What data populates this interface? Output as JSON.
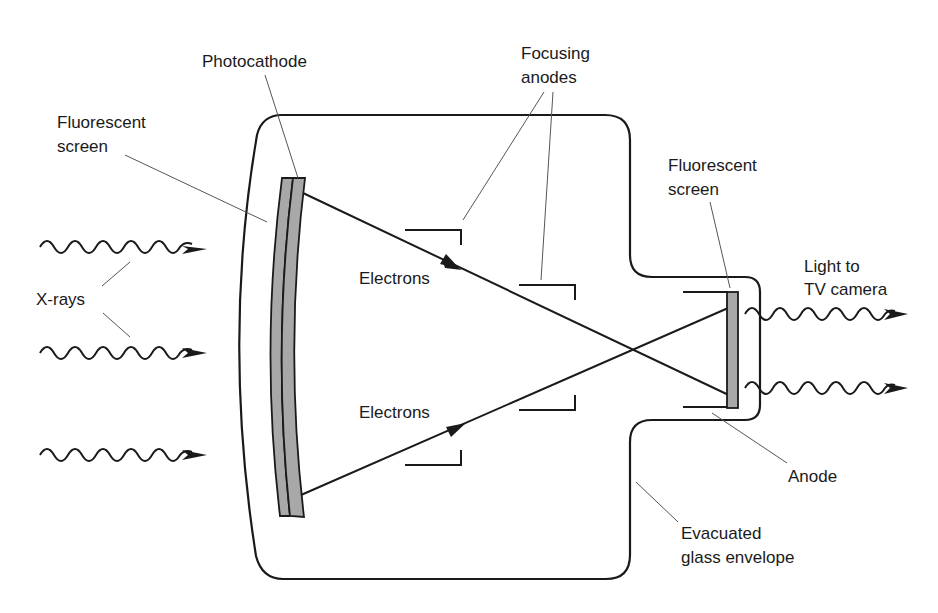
{
  "diagram": {
    "colors": {
      "stroke": "#1a1a1a",
      "leader": "#555555",
      "screen_fill": "#a8a8a8",
      "background": "#ffffff"
    },
    "labels": {
      "photocathode": "Photocathode",
      "focusing_anodes_line1": "Focusing",
      "focusing_anodes_line2": "anodes",
      "fluorescent_screen_input_line1": "Fluorescent",
      "fluorescent_screen_input_line2": "screen",
      "fluorescent_screen_output_line1": "Fluorescent",
      "fluorescent_screen_output_line2": "screen",
      "xrays": "X-rays",
      "electrons_top": "Electrons",
      "electrons_bottom": "Electrons",
      "light_line1": "Light to",
      "light_line2": "TV camera",
      "anode": "Anode",
      "envelope_line1": "Evacuated",
      "envelope_line2": "glass envelope"
    },
    "components": [
      {
        "id": "xray-input",
        "count": 3,
        "type": "wavy-arrow"
      },
      {
        "id": "input-fluorescent-screen",
        "type": "curved-layer"
      },
      {
        "id": "photocathode",
        "type": "curved-layer"
      },
      {
        "id": "focusing-anodes",
        "count": 4,
        "type": "bracket"
      },
      {
        "id": "electron-paths",
        "count": 2,
        "type": "arrow-line"
      },
      {
        "id": "anode",
        "count": 2,
        "type": "bracket"
      },
      {
        "id": "output-fluorescent-screen",
        "type": "rect"
      },
      {
        "id": "light-output",
        "count": 2,
        "type": "wavy-arrow"
      },
      {
        "id": "glass-envelope",
        "type": "outline"
      }
    ]
  }
}
